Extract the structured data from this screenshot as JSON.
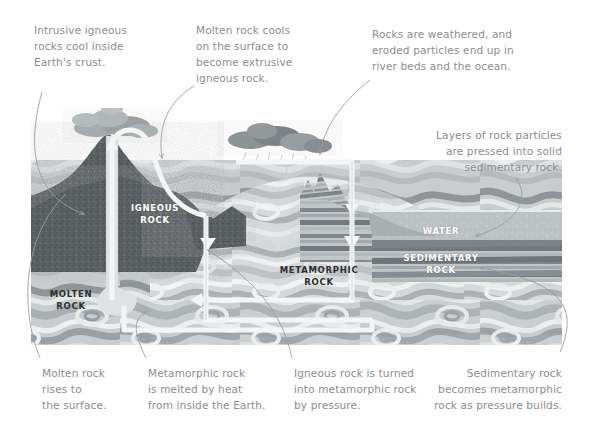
{
  "diagram": {
    "frame": {
      "x": 31,
      "y": 160,
      "width": 531,
      "height": 185
    },
    "palette": {
      "note_text": "#8a8d8f",
      "label_light": "#ffffff",
      "label_dark": "#2d2d2d",
      "igneous_dark": "#5e6265",
      "molten_mid": "#9aa0a3",
      "metamorphic_light": "#cfd3d5",
      "water": "#b9bec1",
      "sedimentary_band": "#8e9497",
      "arrow_white": "#f4f5f5",
      "leader_line": "#9b9e9f",
      "background": "#ffffff"
    },
    "labels": [
      {
        "id": "igneous-rock-label",
        "text": "IGNEOUS\nROCK",
        "tone": "light",
        "x": 124,
        "y": 202
      },
      {
        "id": "molten-rock-label",
        "text": "MOLTEN\nROCK",
        "tone": "dark",
        "x": 40,
        "y": 288
      },
      {
        "id": "metamorphic-rock-label",
        "text": "METAMORPHIC\nROCK",
        "tone": "dark",
        "x": 278,
        "y": 264
      },
      {
        "id": "water-label",
        "text": "WATER",
        "tone": "light",
        "x": 415,
        "y": 225
      },
      {
        "id": "sedimentary-rock-label",
        "text": "SEDIMENTARY\nROCK",
        "tone": "light",
        "x": 396,
        "y": 252
      }
    ],
    "annotations": [
      {
        "id": "intrusive-igneous-note",
        "text": "Intrusive igneous\nrocks cool inside\nEarth's crust.",
        "x": 34,
        "y": 22,
        "align": "left",
        "width": 140
      },
      {
        "id": "extrusive-igneous-note",
        "text": "Molten rock cools\non the surface to\nbecome extrusive\nigneous rock.",
        "x": 196,
        "y": 22,
        "align": "left",
        "width": 130
      },
      {
        "id": "weathering-erosion-note",
        "text": "Rocks are weathered, and\neroded particles end up in\nriver beds and the ocean.",
        "x": 372,
        "y": 26,
        "align": "left",
        "width": 200
      },
      {
        "id": "sedimentary-formation-note",
        "text": "Layers of rock particles\nare pressed into solid\nsedimentary rock.",
        "x": 384,
        "y": 127,
        "align": "right",
        "width": 175
      },
      {
        "id": "molten-rises-note",
        "text": "Molten rock\nrises to\nthe surface.",
        "x": 42,
        "y": 365,
        "align": "left",
        "width": 100
      },
      {
        "id": "metamorphic-melts-note",
        "text": "Metamorphic rock\nis melted by heat\nfrom inside the Earth.",
        "x": 148,
        "y": 365,
        "align": "left",
        "width": 150
      },
      {
        "id": "igneous-to-metamorphic-note",
        "text": "Igneous rock is turned\ninto metamorphic rock\nby pressure.",
        "x": 294,
        "y": 365,
        "align": "left",
        "width": 155
      },
      {
        "id": "sedimentary-to-metamorphic-note",
        "text": "Sedimentary rock\nbecomes metamorphic\nrock as pressure builds.",
        "x": 398,
        "y": 365,
        "align": "right",
        "width": 164
      }
    ]
  }
}
